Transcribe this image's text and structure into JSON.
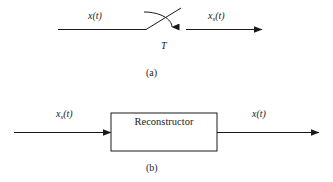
{
  "figure": {
    "stroke_color": "#1a1a1a",
    "background_color": "#ffffff"
  },
  "panel_a": {
    "caption": "(a)",
    "input_signal": "x(t)",
    "input_signal_base": "x",
    "input_signal_arg": "(t)",
    "output_signal_base": "x",
    "output_signal_subscript": "s",
    "output_signal_arg": "(t)",
    "output_signal": "xs(t)",
    "sampler_period_label": "T",
    "element": "sampling-switch"
  },
  "panel_b": {
    "caption": "(b)",
    "input_signal_base": "x",
    "input_signal_subscript": "s",
    "input_signal_arg": "(t)",
    "input_signal": "xs(t)",
    "output_signal_base": "x",
    "output_signal_arg": "(t)",
    "output_signal": "x(t)",
    "block_label": "Reconstructor",
    "element": "reconstructor-block"
  }
}
